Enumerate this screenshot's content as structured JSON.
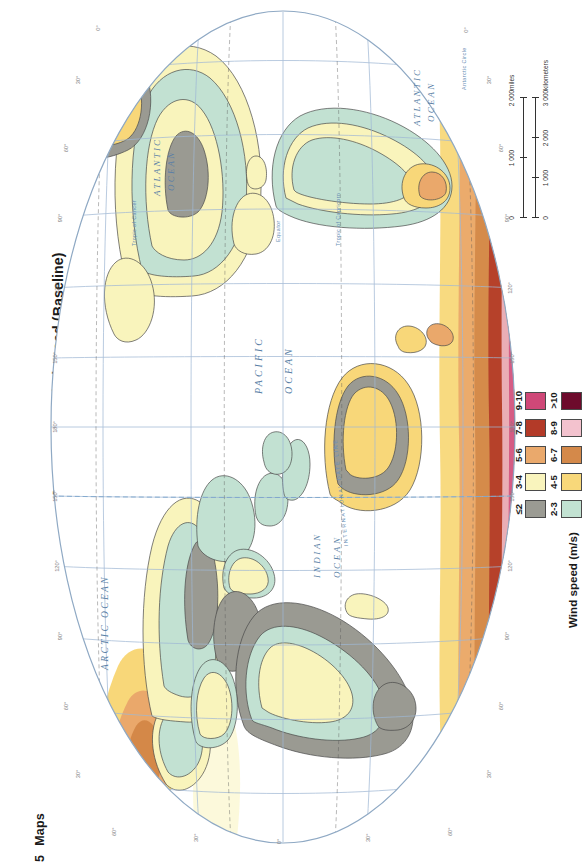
{
  "page": {
    "chapter_number": "5",
    "chapter_name": "Maps",
    "title": "Annual mean wind speed (Baseline)"
  },
  "legend": {
    "title": "Wind speed (m/s)",
    "classes": [
      {
        "label": "≤2",
        "color": "#9b9b93"
      },
      {
        "label": "2-3",
        "color": "#c2e2d2"
      },
      {
        "label": "3-4",
        "color": "#f9f4bd"
      },
      {
        "label": "4-5",
        "color": "#f8d87a"
      },
      {
        "label": "5-6",
        "color": "#eaa96c"
      },
      {
        "label": "6-7",
        "color": "#d4894a"
      },
      {
        "label": "7-8",
        "color": "#b33a28"
      },
      {
        "label": "8-9",
        "color": "#f3c2ce"
      },
      {
        "label": "9-10",
        "color": "#cf4878"
      },
      {
        "label": ">10",
        "color": "#6d0b2c"
      }
    ]
  },
  "scale_bar": {
    "miles": {
      "labels": [
        "0",
        "1 000",
        "2 000"
      ],
      "unit": "miles"
    },
    "kilometers": {
      "labels": [
        "0",
        "1 000",
        "2 000",
        "3 000"
      ],
      "unit": "kilometers"
    }
  },
  "map": {
    "projection_outline_color": "#8fa9c4",
    "graticule_color": "#9fb8d4",
    "ocean_color": "#ffffff",
    "coastline_color": "#4a4a4a",
    "ocean_labels": [
      {
        "text": "ARCTIC OCEAN"
      },
      {
        "text": "ATLANTIC OCEAN"
      },
      {
        "text": "PACIFIC OCEAN"
      },
      {
        "text": "INDIAN OCEAN"
      },
      {
        "text": "ATLANTIC OCEAN"
      }
    ],
    "reference_lines": [
      {
        "text": "Tropic of Cancer"
      },
      {
        "text": "Equator"
      },
      {
        "text": "Tropic of Capricorn"
      },
      {
        "text": "Antarctic Circle"
      },
      {
        "text": "INTERNATIONAL DATE LINE"
      }
    ],
    "longitude_labels": [
      "0°",
      "30°",
      "60°",
      "90°",
      "120°",
      "150°",
      "180°",
      "150°",
      "120°",
      "90°",
      "60°",
      "30°"
    ],
    "latitude_labels": [
      "60°",
      "30°",
      "0°",
      "30°",
      "60°"
    ],
    "date_line_label": "180°"
  }
}
